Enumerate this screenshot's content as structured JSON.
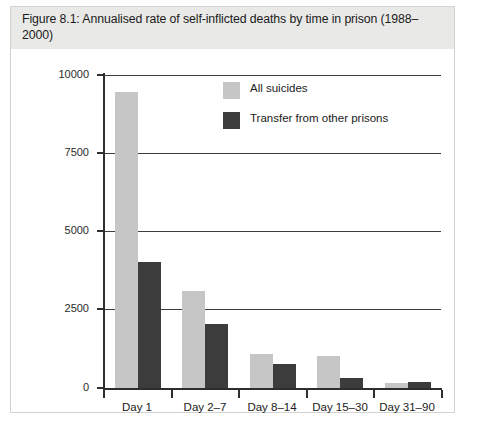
{
  "figure": {
    "title": "Figure 8.1: Annualised rate of self-inflicted deaths by time in prison (1988–2000)"
  },
  "legend": {
    "items": [
      {
        "label": "All suicides",
        "color": "#c6c6c6"
      },
      {
        "label": "Transfer from other prisons",
        "color": "#3c3c3c"
      }
    ]
  },
  "axis": {
    "y_ticks": [
      "10000",
      "7500",
      "5000",
      "2500",
      "0"
    ]
  },
  "chart_data": {
    "type": "bar",
    "title": "Figure 8.1: Annualised rate of self-inflicted deaths by time in prison (1988–2000)",
    "xlabel": "",
    "ylabel": "",
    "ylim": [
      0,
      10000
    ],
    "yticks": [
      0,
      2500,
      5000,
      7500,
      10000
    ],
    "grid": true,
    "legend_position": "upper-right-inside",
    "categories": [
      "Day 1",
      "Day 2–7",
      "Day 8–14",
      "Day 15–30",
      "Day 31–90"
    ],
    "series": [
      {
        "name": "All suicides",
        "color": "#c6c6c6",
        "values": [
          9450,
          3100,
          1100,
          1020,
          170
        ]
      },
      {
        "name": "Transfer from other prisons",
        "color": "#3c3c3c",
        "values": [
          4020,
          2060,
          770,
          330,
          190
        ]
      }
    ]
  }
}
